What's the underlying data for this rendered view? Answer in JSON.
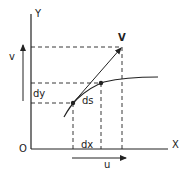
{
  "labels": {
    "y_axis": "Y",
    "x_axis": "X",
    "origin": "O",
    "velocity": "V",
    "v_component": "v",
    "u_component": "u",
    "dy": "dy",
    "dx": "dx",
    "ds": "ds"
  },
  "colors": {
    "line": "#222222",
    "background": "#ffffff"
  }
}
